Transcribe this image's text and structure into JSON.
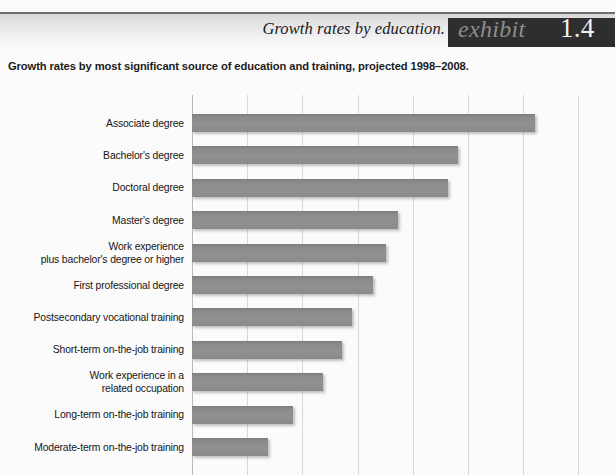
{
  "header": {
    "title": "Growth rates by education.",
    "exhibit_word": "exhibit",
    "exhibit_number": "1.4"
  },
  "subtitle": "Growth rates by most significant source of education and training, projected 1998–2008.",
  "chart_data": {
    "type": "bar",
    "orientation": "horizontal",
    "title": "Growth rates by education.",
    "subtitle": "Growth rates by most significant source of education and training, projected 1998–2008.",
    "xlabel": "",
    "ylabel": "",
    "grid": true,
    "legend": false,
    "bar_color": "#8b8b8c",
    "xlim": [
      0,
      55
    ],
    "xticks": [
      0,
      7,
      14,
      21,
      28,
      35,
      42,
      49
    ],
    "categories": [
      "Associate degree",
      "Bachelor's degree",
      "Doctoral degree",
      "Master's degree",
      "Work experience plus bachelor's degree or higher",
      "First professional degree",
      "Postsecondary vocational training",
      "Short-term on-the-job training",
      "Work experience in a related occupation",
      "Long-term on-the-job training",
      "Moderate-term on-the-job training"
    ],
    "category_lines": [
      [
        "Associate degree"
      ],
      [
        "Bachelor's degree"
      ],
      [
        "Doctoral degree"
      ],
      [
        "Master's degree"
      ],
      [
        "Work experience",
        "plus bachelor's degree or higher"
      ],
      [
        "First professional degree"
      ],
      [
        "Postsecondary vocational training"
      ],
      [
        "Short-term on-the-job training"
      ],
      [
        "Work experience in a",
        "related occupation"
      ],
      [
        "Long-term on-the-job training"
      ],
      [
        "Moderate-term on-the-job training"
      ]
    ],
    "values": [
      44.0,
      33.5,
      32.3,
      26.0,
      24.5,
      23.0,
      20.5,
      19.0,
      16.5,
      12.7,
      9.6
    ],
    "bar_pixel_widths": [
      343,
      266,
      256,
      206,
      194,
      181,
      160,
      150,
      131,
      101,
      76
    ]
  }
}
